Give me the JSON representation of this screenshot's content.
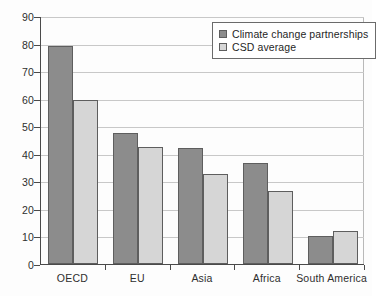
{
  "chart_data": {
    "type": "bar",
    "title": "",
    "subtitle": "",
    "xlabel": "",
    "ylabel": "",
    "categories": [
      "OECD",
      "EU",
      "Asia",
      "Africa",
      "South America"
    ],
    "series": [
      {
        "name": "Climate change partnerships",
        "color": "#8c8c8c",
        "values": [
          79,
          47.5,
          42,
          36.5,
          10
        ]
      },
      {
        "name": "CSD average",
        "color": "#d6d6d6",
        "values": [
          59.5,
          42.5,
          32.5,
          26.5,
          12
        ]
      }
    ],
    "ylim": [
      0,
      90
    ],
    "yticks": [
      0,
      10,
      20,
      30,
      40,
      50,
      60,
      70,
      80,
      90
    ],
    "ytick_labels": [
      "0",
      "10",
      "20",
      "30",
      "40",
      "50",
      "60",
      "70",
      "80",
      "90"
    ],
    "grid": true,
    "grid_axis": "y",
    "legend_position": "top-right",
    "legend": [
      {
        "label": "Climate change partnerships",
        "swatch": "#8c8c8c"
      },
      {
        "label": "CSD average",
        "swatch": "#d6d6d6"
      }
    ]
  },
  "colors": {
    "series_dark": "#8c8c8c",
    "series_light": "#d6d6d6",
    "bar_border": "#5e5e5e",
    "axis": "#4a4a4a",
    "gridline": "#c8c8c8",
    "text": "#2e2e2e",
    "background": "#fdfdfd"
  }
}
